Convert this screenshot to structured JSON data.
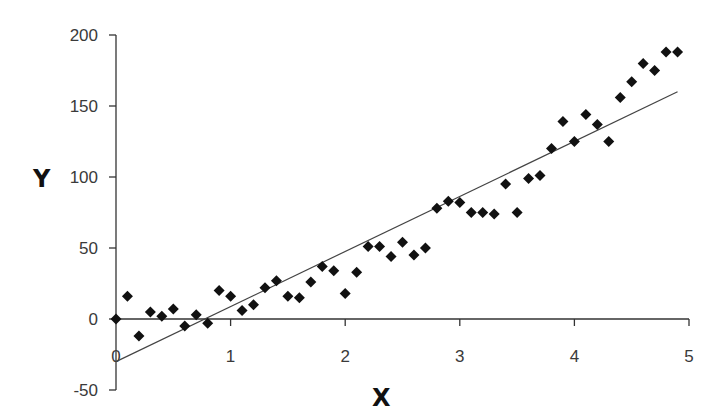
{
  "chart_data": {
    "type": "scatter",
    "title": "",
    "xlabel": "X",
    "ylabel": "Y",
    "xlim": [
      0,
      5
    ],
    "ylim": [
      -50,
      200
    ],
    "x_ticks": [
      0,
      1,
      2,
      3,
      4,
      5
    ],
    "x_tick_labels": [
      "0",
      "1",
      "2",
      "3",
      "4",
      "5"
    ],
    "y_ticks": [
      -50,
      0,
      50,
      100,
      150,
      200
    ],
    "y_tick_labels": [
      "-50",
      "0",
      "50",
      "100",
      "150",
      "200"
    ],
    "grid": false,
    "legend": null,
    "series": [
      {
        "name": "data",
        "kind": "scatter",
        "marker": "diamond",
        "color": "#111111",
        "x": [
          0.0,
          0.1,
          0.2,
          0.3,
          0.4,
          0.5,
          0.6,
          0.7,
          0.8,
          0.9,
          1.0,
          1.1,
          1.2,
          1.3,
          1.4,
          1.5,
          1.6,
          1.7,
          1.8,
          1.9,
          2.0,
          2.1,
          2.2,
          2.3,
          2.4,
          2.5,
          2.6,
          2.7,
          2.8,
          2.9,
          3.0,
          3.1,
          3.2,
          3.3,
          3.4,
          3.5,
          3.6,
          3.7,
          3.8,
          3.9,
          4.0,
          4.1,
          4.2,
          4.3,
          4.4,
          4.5,
          4.6,
          4.7,
          4.8,
          4.9
        ],
        "y": [
          0,
          16,
          -12,
          5,
          2,
          7,
          -5,
          3,
          -3,
          20,
          16,
          6,
          10,
          22,
          27,
          16,
          15,
          26,
          37,
          34,
          18,
          33,
          51,
          51,
          44,
          54,
          45,
          50,
          78,
          83,
          82,
          75,
          75,
          74,
          95,
          75,
          99,
          101,
          120,
          139,
          125,
          144,
          137,
          125,
          156,
          167,
          180,
          175,
          188,
          188
        ]
      },
      {
        "name": "linear fit",
        "kind": "line",
        "color": "#444444",
        "x": [
          0,
          4.9
        ],
        "y": [
          -30,
          160
        ]
      }
    ]
  },
  "layout": {
    "plot_origin_px": [
      116,
      319
    ],
    "px_per_x_unit": 114.6,
    "px_per_y_unit": 1.42
  }
}
